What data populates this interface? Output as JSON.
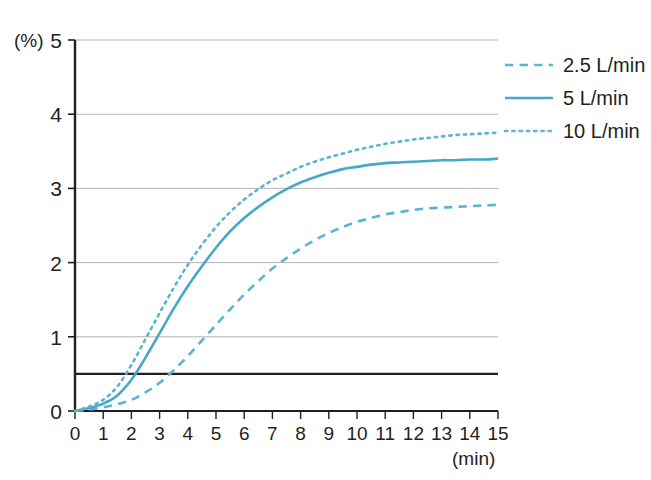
{
  "chart_data": {
    "type": "line",
    "title": "",
    "xlabel": "(min)",
    "ylabel": "(%)",
    "xlim": [
      0,
      15
    ],
    "ylim": [
      0,
      5
    ],
    "grid": true,
    "legend_position": "top-right",
    "x_ticks": [
      "0",
      "1",
      "2",
      "3",
      "4",
      "5",
      "6",
      "7",
      "8",
      "9",
      "10",
      "11",
      "12",
      "13",
      "14",
      "15"
    ],
    "y_ticks": [
      "0",
      "1",
      "2",
      "3",
      "4",
      "5"
    ],
    "x": [
      0,
      0.5,
      1,
      1.5,
      2,
      2.5,
      3,
      3.5,
      4,
      4.5,
      5,
      5.5,
      6,
      6.5,
      7,
      7.5,
      8,
      8.5,
      9,
      9.5,
      10,
      10.5,
      11,
      11.5,
      12,
      12.5,
      13,
      13.5,
      14,
      14.5,
      15
    ],
    "series": [
      {
        "name": "2.5 L/min",
        "style": "dashed",
        "color": "#5AB4D2",
        "values": [
          0.0,
          0.02,
          0.05,
          0.09,
          0.15,
          0.25,
          0.38,
          0.55,
          0.74,
          0.95,
          1.16,
          1.37,
          1.57,
          1.75,
          1.92,
          2.06,
          2.19,
          2.3,
          2.4,
          2.48,
          2.55,
          2.6,
          2.65,
          2.68,
          2.71,
          2.73,
          2.74,
          2.75,
          2.76,
          2.77,
          2.78
        ]
      },
      {
        "name": "5 L/min",
        "style": "solid",
        "color": "#45A8C8",
        "values": [
          0.0,
          0.04,
          0.1,
          0.21,
          0.42,
          0.72,
          1.05,
          1.38,
          1.68,
          1.95,
          2.2,
          2.42,
          2.6,
          2.75,
          2.88,
          2.99,
          3.08,
          3.15,
          3.21,
          3.26,
          3.29,
          3.32,
          3.34,
          3.35,
          3.36,
          3.37,
          3.38,
          3.38,
          3.39,
          3.39,
          3.4
        ]
      },
      {
        "name": "10 L/min",
        "style": "dotted",
        "color": "#5AB4D2",
        "values": [
          0.0,
          0.06,
          0.15,
          0.33,
          0.62,
          0.97,
          1.32,
          1.66,
          1.97,
          2.24,
          2.48,
          2.68,
          2.85,
          2.99,
          3.11,
          3.2,
          3.29,
          3.36,
          3.42,
          3.47,
          3.52,
          3.56,
          3.6,
          3.63,
          3.66,
          3.68,
          3.7,
          3.72,
          3.73,
          3.74,
          3.75
        ]
      }
    ],
    "threshold_line": {
      "name": "threshold",
      "value": 0.5,
      "color": "#231f20"
    }
  },
  "legend": {
    "items": [
      {
        "label": "2.5 L/min",
        "style": "dashed"
      },
      {
        "label": "5 L/min",
        "style": "solid"
      },
      {
        "label": "10 L/min",
        "style": "dotted"
      }
    ]
  },
  "axes": {
    "y_unit": "(%)",
    "x_unit": "(min)"
  },
  "colors": {
    "line": "#45A8C8",
    "line_light": "#5AB4D2",
    "grid": "#b3b3b3",
    "axis": "#231f20",
    "text": "#231f20"
  }
}
